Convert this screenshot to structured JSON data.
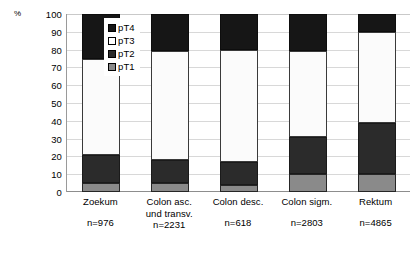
{
  "chart_data": {
    "type": "bar",
    "subtype": "stacked-bar-100",
    "title": "",
    "xlabel": "",
    "ylabel": "%",
    "ylim": [
      0,
      100
    ],
    "grid": true,
    "legend_position": "inside-top-left",
    "y_unit_label": "%",
    "y_ticks": [
      100,
      90,
      80,
      70,
      60,
      50,
      40,
      30,
      20,
      10,
      0
    ],
    "y_tick_labels": [
      "100",
      "90",
      "80",
      "70",
      "60",
      "50",
      "40",
      "30",
      "20",
      "10",
      "0"
    ],
    "categories": [
      "Zoekum",
      "Colon asc. und transv.",
      "Colon desc.",
      "Colon sigm.",
      "Rektum"
    ],
    "category_lines": [
      [
        "Zoekum"
      ],
      [
        "Colon asc.",
        "und transv."
      ],
      [
        "Colon desc."
      ],
      [
        "Colon sigm."
      ],
      [
        "Rektum"
      ]
    ],
    "category_counts": [
      "n=976",
      "n=2231",
      "n=618",
      "n=2803",
      "n=4865"
    ],
    "series": [
      {
        "name": "pT1",
        "color": "#8a8a8a",
        "values": [
          5,
          5,
          4,
          10,
          10
        ]
      },
      {
        "name": "pT2",
        "color": "#2b2b2b",
        "values": [
          16,
          13,
          13,
          21,
          29
        ]
      },
      {
        "name": "pT3",
        "color": "#ffffff",
        "values": [
          54,
          61,
          63,
          48,
          51
        ]
      },
      {
        "name": "pT4",
        "color": "#161616",
        "values": [
          25,
          21,
          20,
          21,
          10
        ]
      }
    ],
    "legend": [
      {
        "label": "pT4",
        "color": "#161616"
      },
      {
        "label": "pT3",
        "color": "#ffffff"
      },
      {
        "label": "pT2",
        "color": "#2b2b2b"
      },
      {
        "label": "pT1",
        "color": "#8a8a8a"
      }
    ]
  }
}
